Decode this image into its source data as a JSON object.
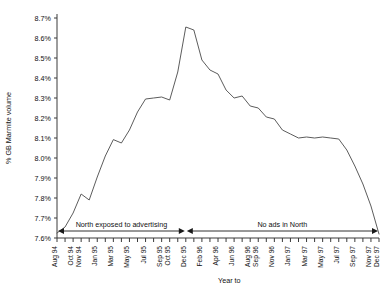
{
  "chart_data": {
    "type": "line",
    "title": "",
    "xlabel": "Year to",
    "ylabel": "% GB Marmite volume",
    "ylim": [
      7.6,
      8.7
    ],
    "ytick_labels": [
      "7.6%",
      "7.7%",
      "7.8%",
      "7.9%",
      "8.0%",
      "8.1%",
      "8.2%",
      "8.3%",
      "8.4%",
      "8.5%",
      "8.6%",
      "8.7%"
    ],
    "ytick_values": [
      7.6,
      7.7,
      7.8,
      7.9,
      8.0,
      8.1,
      8.2,
      8.3,
      8.4,
      8.5,
      8.6,
      8.7
    ],
    "grid": false,
    "legend": "none",
    "x_tick_labels": [
      "Aug 94",
      "",
      "Oct 94",
      "Nov 94",
      "",
      "Jan 95",
      "",
      "Mar 95",
      "",
      "May 95",
      "",
      "Jul 95",
      "",
      "Sep 95",
      "Oct 95",
      "",
      "Dec 95",
      "",
      "Feb 96",
      "",
      "Apr 96",
      "",
      "Jun 96",
      "",
      "Aug 96",
      "Sep 96",
      "",
      "Nov 96",
      "",
      "Jan 97",
      "",
      "Mar 97",
      "",
      "May 97",
      "",
      "Jul 97",
      "",
      "Sep 97",
      "",
      "Nov 97",
      "Dec 97"
    ],
    "x": [
      "Aug 94",
      "Sep 94",
      "Oct 94",
      "Nov 94",
      "Dec 94",
      "Jan 95",
      "Feb 95",
      "Mar 95",
      "Apr 95",
      "May 95",
      "Jun 95",
      "Jul 95",
      "Aug 95",
      "Sep 95",
      "Oct 95",
      "Nov 95",
      "Dec 95",
      "Jan 96",
      "Feb 96",
      "Mar 96",
      "Apr 96",
      "May 96",
      "Jun 96",
      "Jul 96",
      "Aug 96",
      "Sep 96",
      "Oct 96",
      "Nov 96",
      "Dec 96",
      "Jan 97",
      "Feb 97",
      "Mar 97",
      "Apr 97",
      "May 97",
      "Jun 97",
      "Jul 97",
      "Aug 97",
      "Sep 97",
      "Oct 97",
      "Nov 97",
      "Dec 97"
    ],
    "values": [
      7.625,
      7.655,
      7.725,
      7.82,
      7.79,
      7.905,
      8.01,
      8.092,
      8.075,
      8.14,
      8.23,
      8.295,
      8.3,
      8.305,
      8.29,
      8.43,
      8.655,
      8.64,
      8.49,
      8.44,
      8.42,
      8.34,
      8.3,
      8.31,
      8.26,
      8.25,
      8.205,
      8.195,
      8.14,
      8.12,
      8.1,
      8.105,
      8.1,
      8.105,
      8.1,
      8.095,
      8.04,
      7.96,
      7.87,
      7.76,
      7.62
    ],
    "annotations": [
      {
        "name": "north-exposed",
        "label": "North exposed to advertising",
        "from": "Aug 94",
        "to": "Dec 95"
      },
      {
        "name": "no-ads",
        "label": "No ads in North",
        "from": "Dec 95",
        "to": "Dec 97"
      }
    ]
  }
}
